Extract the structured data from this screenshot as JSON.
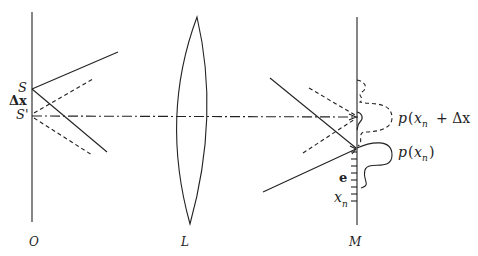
{
  "diagram": {
    "planes": {
      "object": {
        "label": "O"
      },
      "lens": {
        "label": "L"
      },
      "detector": {
        "label": "M"
      }
    },
    "source_labels": {
      "S": "S",
      "delta": "Δx",
      "S_prime": "S'"
    },
    "detector_labels": {
      "p_shifted_p": "p",
      "p_shifted_open": "(",
      "p_shifted_x": "x",
      "p_shifted_sub": "n",
      "p_shifted_rest": "+ Δx",
      "p_p": "p",
      "p_open": "(",
      "p_x": "x",
      "p_sub": "n",
      "p_close": ")",
      "e": "e",
      "xn_x": "x",
      "xn_sub": "n"
    },
    "legend": {
      "solid": "rays from S / p(xn)",
      "dashed": "rays from S' / p(xn + Δx)",
      "dashdot": "optical axis"
    },
    "colors": {
      "ink": "#222222",
      "background": "#ffffff"
    }
  }
}
